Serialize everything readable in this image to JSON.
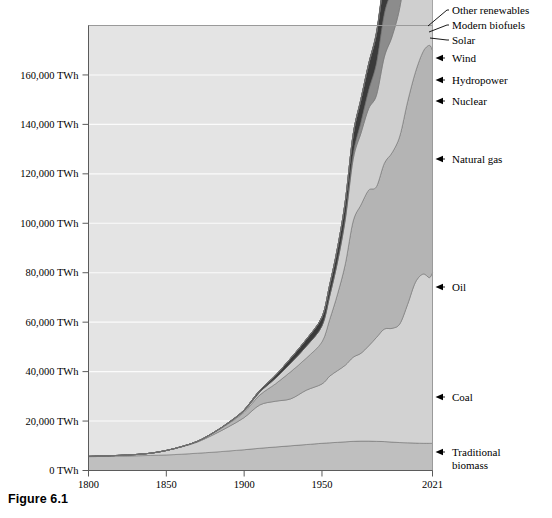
{
  "figure": {
    "caption": "Figure 6.1"
  },
  "chart_data": {
    "type": "area",
    "title": "",
    "subtitle": "",
    "xlabel": "",
    "ylabel": "",
    "stacked": true,
    "grid": true,
    "legend_position": "right-annotations",
    "xlim": [
      1800,
      2021
    ],
    "ylim": [
      0,
      180000
    ],
    "x_tick_labels": [
      "1800",
      "1850",
      "1900",
      "1950",
      "2021"
    ],
    "x_ticks": [
      1800,
      1850,
      1900,
      1950,
      2021
    ],
    "y_tick_labels": [
      "0 TWh",
      "20,000 TWh",
      "40,000 TWh",
      "60,000 TWh",
      "80,000 TWh",
      "100,000 TWh",
      "120,000 TWh",
      "140,000 TWh",
      "160,000 TWh"
    ],
    "y_ticks": [
      0,
      20000,
      40000,
      60000,
      80000,
      100000,
      120000,
      140000,
      160000
    ],
    "y_unit": "TWh",
    "x": [
      1800,
      1810,
      1820,
      1830,
      1840,
      1850,
      1860,
      1870,
      1880,
      1890,
      1900,
      1910,
      1920,
      1930,
      1940,
      1950,
      1955,
      1960,
      1965,
      1970,
      1975,
      1980,
      1985,
      1990,
      1995,
      2000,
      2005,
      2010,
      2015,
      2019,
      2021
    ],
    "series": [
      {
        "name": "Traditional biomass",
        "color": "#bfbfbf",
        "values": [
          5600,
          5700,
          5800,
          5950,
          6100,
          6300,
          6600,
          7000,
          7400,
          7900,
          8400,
          9000,
          9500,
          10000,
          10500,
          11000,
          11200,
          11400,
          11600,
          11800,
          11900,
          11900,
          11800,
          11700,
          11500,
          11300,
          11200,
          11100,
          11000,
          11000,
          11000
        ]
      },
      {
        "name": "Coal",
        "color": "#d2d2d2",
        "values": [
          100,
          200,
          320,
          500,
          900,
          1800,
          3000,
          4500,
          7000,
          9800,
          13000,
          17500,
          18500,
          19000,
          22000,
          24000,
          27000,
          29000,
          31000,
          34000,
          35500,
          38500,
          42000,
          45500,
          46000,
          48000,
          56000,
          65000,
          68500,
          67000,
          69000
        ]
      },
      {
        "name": "Oil",
        "color": "#b4b4b4",
        "values": [
          0,
          0,
          0,
          0,
          0,
          0,
          100,
          300,
          700,
          1300,
          2200,
          4000,
          7000,
          11000,
          13000,
          17000,
          23000,
          31000,
          41000,
          55000,
          60000,
          63000,
          61000,
          67000,
          71000,
          76000,
          82000,
          85000,
          90000,
          94000,
          90000
        ]
      },
      {
        "name": "Natural gas",
        "color": "#cfcfcf",
        "values": [
          0,
          0,
          0,
          0,
          0,
          0,
          0,
          0,
          100,
          300,
          600,
          1200,
          2200,
          3500,
          4800,
          6500,
          9500,
          13000,
          18000,
          25000,
          29000,
          33000,
          37000,
          43000,
          47000,
          52000,
          58000,
          64000,
          70000,
          77000,
          79000
        ]
      },
      {
        "name": "Nuclear",
        "color": "#8c8c8c",
        "values": [
          0,
          0,
          0,
          0,
          0,
          0,
          0,
          0,
          0,
          0,
          0,
          0,
          0,
          0,
          0,
          0,
          100,
          300,
          800,
          2000,
          4500,
          7500,
          13000,
          17500,
          19500,
          21500,
          22500,
          22000,
          21000,
          22500,
          23000
        ]
      },
      {
        "name": "Hydropower",
        "color": "#3a3a3a",
        "values": [
          0,
          0,
          0,
          0,
          0,
          0,
          0,
          0,
          0,
          100,
          300,
          700,
          1200,
          2000,
          2800,
          3600,
          4400,
          5400,
          6600,
          8000,
          9200,
          10500,
          12000,
          13500,
          14800,
          16000,
          17500,
          19500,
          21500,
          23500,
          24500
        ]
      },
      {
        "name": "Wind",
        "color": "#5a5a5a",
        "values": [
          0,
          0,
          0,
          0,
          0,
          0,
          0,
          0,
          0,
          0,
          0,
          0,
          0,
          0,
          0,
          0,
          0,
          0,
          0,
          0,
          0,
          0,
          50,
          100,
          200,
          500,
          1000,
          2000,
          4200,
          6800,
          8000
        ]
      },
      {
        "name": "Solar",
        "color": "#232323",
        "values": [
          0,
          0,
          0,
          0,
          0,
          0,
          0,
          0,
          0,
          0,
          0,
          0,
          0,
          0,
          0,
          0,
          0,
          0,
          0,
          0,
          0,
          0,
          0,
          0,
          20,
          50,
          150,
          600,
          2200,
          4500,
          5800
        ]
      },
      {
        "name": "Modern biofuels",
        "color": "#707070",
        "values": [
          0,
          0,
          0,
          0,
          0,
          0,
          0,
          0,
          0,
          0,
          0,
          0,
          0,
          0,
          0,
          0,
          0,
          0,
          0,
          0,
          50,
          120,
          250,
          400,
          600,
          900,
          1500,
          2300,
          2900,
          3200,
          3300
        ]
      },
      {
        "name": "Other renewables",
        "color": "#1a1a1a",
        "values": [
          0,
          0,
          0,
          0,
          0,
          0,
          0,
          0,
          0,
          0,
          0,
          0,
          0,
          0,
          0,
          0,
          0,
          0,
          0,
          50,
          100,
          200,
          350,
          600,
          900,
          1200,
          1600,
          2000,
          2400,
          2700,
          2900
        ]
      }
    ],
    "annotations": [
      {
        "label": "Other renewables",
        "label_x": 452,
        "label_y": 14,
        "arrow": false,
        "leader_from_x": 447,
        "leader_from_y": 10,
        "leader_to_x": 428,
        "leader_to_y": 26
      },
      {
        "label": "Modern biofuels",
        "label_x": 452,
        "label_y": 29,
        "arrow": false,
        "leader_from_x": 447,
        "leader_from_y": 25,
        "leader_to_x": 429,
        "leader_to_y": 32
      },
      {
        "label": "Solar",
        "label_x": 452,
        "label_y": 44,
        "arrow": false,
        "leader_from_x": 447,
        "leader_from_y": 40,
        "leader_to_x": 430,
        "leader_to_y": 38
      },
      {
        "label": "Wind",
        "label_x": 452,
        "label_y": 62,
        "arrow": true
      },
      {
        "label": "Hydropower",
        "label_x": 452,
        "label_y": 84,
        "arrow": true
      },
      {
        "label": "Nuclear",
        "label_x": 452,
        "label_y": 105,
        "arrow": true
      },
      {
        "label": "Natural gas",
        "label_x": 452,
        "label_y": 163,
        "arrow": true
      },
      {
        "label": "Oil",
        "label_x": 452,
        "label_y": 291,
        "arrow": true
      },
      {
        "label": "Coal",
        "label_x": 452,
        "label_y": 401,
        "arrow": true
      },
      {
        "label": "Traditional biomass",
        "label_x": 452,
        "label_y": 456,
        "arrow": true,
        "wrap": "Traditional|biomass"
      }
    ]
  }
}
